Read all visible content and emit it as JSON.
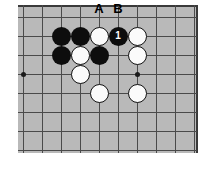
{
  "diagram": {
    "type": "go-board-diagram",
    "board_background_color": "#b9b9b9",
    "line_color": "#4a4a4a",
    "grid": {
      "origin_x": 23,
      "origin_y": 17,
      "spacing": 19,
      "cols": 10,
      "rows": 8
    },
    "star_points": [
      {
        "col": 0,
        "row": 3
      },
      {
        "col": 6,
        "row": 3
      }
    ],
    "stones": [
      {
        "col": 2,
        "row": 1,
        "color": "black",
        "label": ""
      },
      {
        "col": 3,
        "row": 1,
        "color": "black",
        "label": ""
      },
      {
        "col": 4,
        "row": 1,
        "color": "white",
        "label": ""
      },
      {
        "col": 5,
        "row": 1,
        "color": "black",
        "label": "1"
      },
      {
        "col": 6,
        "row": 1,
        "color": "white",
        "label": ""
      },
      {
        "col": 2,
        "row": 2,
        "color": "black",
        "label": ""
      },
      {
        "col": 3,
        "row": 2,
        "color": "white",
        "label": ""
      },
      {
        "col": 4,
        "row": 2,
        "color": "black",
        "label": ""
      },
      {
        "col": 6,
        "row": 2,
        "color": "white",
        "label": ""
      },
      {
        "col": 3,
        "row": 3,
        "color": "white",
        "label": ""
      },
      {
        "col": 4,
        "row": 4,
        "color": "white",
        "label": ""
      },
      {
        "col": 6,
        "row": 4,
        "color": "white",
        "label": ""
      }
    ],
    "point_labels": [
      {
        "text": "A",
        "col": 4
      },
      {
        "text": "B",
        "col": 5
      }
    ]
  }
}
